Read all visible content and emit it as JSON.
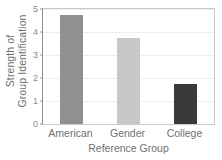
{
  "chart_data": {
    "type": "bar",
    "title": "",
    "categories": [
      "American",
      "Gender",
      "College"
    ],
    "values": [
      4.75,
      3.75,
      1.75
    ],
    "series": [
      {
        "name": "Strength of Group Identification",
        "values": [
          4.75,
          3.75,
          1.75
        ]
      }
    ],
    "bar_colors": [
      "#909090",
      "#c8c8c8",
      "#3a3a3a"
    ],
    "xlabel": "Reference Group",
    "ylabel": "Strength of Group Identification",
    "ylabel_line1": "Strength of",
    "ylabel_line2": "Group Identification",
    "ylim": [
      0,
      5
    ],
    "yticks": [
      0,
      1,
      2,
      3,
      4,
      5
    ],
    "ytick_labels": [
      "0",
      "1",
      "2",
      "3",
      "4",
      "5"
    ],
    "grid": true,
    "grid_axis": "y",
    "legend": false,
    "legend_position": "none"
  },
  "style": {
    "background": "#ffffff",
    "axis_color": "#8d8d8d",
    "frame_color": "#c9c9c9",
    "grid_color": "#ededed",
    "text_color": "#6f6f6f",
    "tick_text_color": "#8a8a8a"
  }
}
